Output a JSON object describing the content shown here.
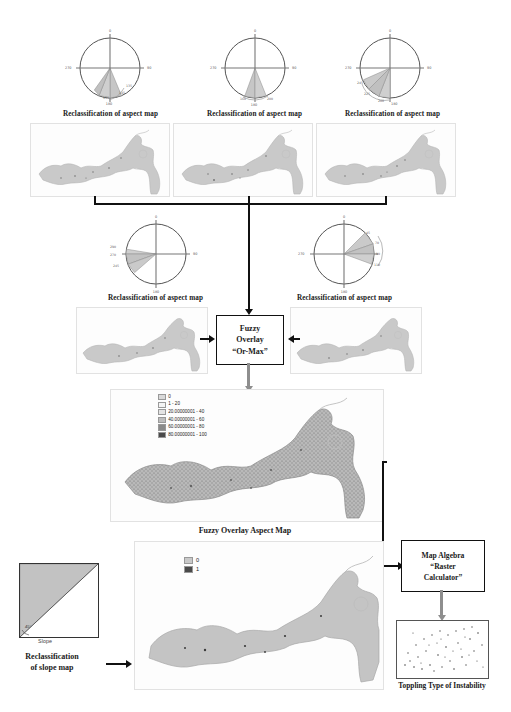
{
  "diagram": {
    "caption_aspect": "Reclassification of aspect map",
    "caption_fuzzy_map": "Fuzzy Overlay Aspect Map",
    "caption_slope_reclass_line1": "Reclassification",
    "caption_slope_reclass_line2": "of slope map",
    "caption_output": "Toppling Type of Instability",
    "slope_axis_label": "Slope",
    "slope_angle_label": "45°"
  },
  "process_boxes": [
    {
      "id": "fuzzy-overlay",
      "lines": [
        "Fuzzy",
        "Overlay",
        "“Or-Max”"
      ]
    },
    {
      "id": "map-algebra",
      "lines": [
        "Map Algebra",
        "“Raster",
        "Calculator”"
      ]
    }
  ],
  "fuzzy_box": {
    "line1": "Fuzzy",
    "line2": "Overlay",
    "line3": "“Or-Max”"
  },
  "algebra_box": {
    "line1": "Map Algebra",
    "line2": "“Raster",
    "line3": "Calculator”"
  },
  "roses": [
    {
      "id": "rose-1",
      "caption": "Reclassification of aspect map",
      "axis_labels": {
        "n": "0",
        "e": "90",
        "s": "180",
        "w": "270"
      },
      "wedge_labels": [
        "135",
        "145",
        "155",
        "180"
      ],
      "wedges": [
        {
          "start": 112,
          "end": 135
        },
        {
          "start": 135,
          "end": 158
        },
        {
          "start": 158,
          "end": 180
        }
      ]
    },
    {
      "id": "rose-2",
      "caption": "Reclassification of aspect map",
      "axis_labels": {
        "n": "0",
        "e": "90",
        "s": "180",
        "w": "270"
      },
      "wedge_labels": [
        "160",
        "180",
        "200"
      ],
      "wedges": [
        {
          "start": 160,
          "end": 180
        },
        {
          "start": 180,
          "end": 202
        }
      ]
    },
    {
      "id": "rose-3",
      "caption": "Reclassification of aspect map",
      "axis_labels": {
        "n": "0",
        "e": "90",
        "s": "180",
        "w": "270"
      },
      "wedge_labels": [
        "180",
        "200",
        "225",
        "245"
      ],
      "wedges": [
        {
          "start": 180,
          "end": 203
        },
        {
          "start": 203,
          "end": 225
        },
        {
          "start": 225,
          "end": 248
        }
      ]
    },
    {
      "id": "rose-4",
      "caption": "Reclassification of aspect map",
      "axis_labels": {
        "n": "0",
        "e": "90",
        "s": "180",
        "w": "270"
      },
      "wedge_labels": [
        "245",
        "270",
        "290"
      ],
      "wedges": [
        {
          "start": 248,
          "end": 270
        },
        {
          "start": 270,
          "end": 292
        }
      ]
    },
    {
      "id": "rose-5",
      "caption": "Reclassification of aspect map",
      "axis_labels": {
        "n": "0",
        "e": "90",
        "s": "180",
        "w": "270"
      },
      "wedge_labels": [
        "45",
        "70",
        "90",
        "110"
      ],
      "wedges": [
        {
          "start": 45,
          "end": 68
        },
        {
          "start": 68,
          "end": 90
        },
        {
          "start": 90,
          "end": 112
        }
      ]
    }
  ],
  "fuzzy_legend": {
    "title": "",
    "items": [
      {
        "label": "0",
        "color": "#d9d9d9"
      },
      {
        "label": "1 - 20",
        "color": "#f2f2f2"
      },
      {
        "label": "20.00000001 - 40",
        "color": "#e0e0e0"
      },
      {
        "label": "40.00000001 - 60",
        "color": "#bdbdbd"
      },
      {
        "label": "60.00000001 - 80",
        "color": "#8a8a8a"
      },
      {
        "label": "80.00000001 - 100",
        "color": "#4a4a4a"
      }
    ]
  },
  "slope_legend": {
    "items": [
      {
        "label": "0",
        "color": "#c9c9c9"
      },
      {
        "label": "1",
        "color": "#4a4a4a"
      }
    ]
  },
  "colors": {
    "line": "#111111",
    "line_gray": "#8e8e8e",
    "map_fill": "#c9c9c9",
    "map_stroke": "#b0b0b0",
    "wedge_fill": "#bfbfbf",
    "wedge_stroke": "#777777"
  }
}
